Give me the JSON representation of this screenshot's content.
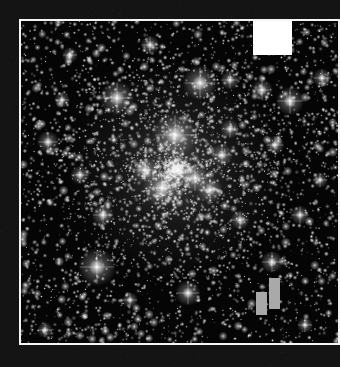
{
  "image": {
    "subject": "star cluster field (grayscale)",
    "width": 340,
    "height": 367,
    "colors": {
      "outer_background": "#141414",
      "frame": "#f4f4f4",
      "field_background": "#050505",
      "marker_square": "#ffffff",
      "bars": "#a9a9a9"
    }
  },
  "frame": {
    "x": 19,
    "y": 19,
    "width": 321,
    "height": 326
  },
  "overlay": {
    "marker_square": {
      "x": 253,
      "y": 21,
      "width": 39,
      "height": 34
    },
    "bars": [
      {
        "x": 256,
        "y": 292,
        "width": 11,
        "height": 23
      },
      {
        "x": 269,
        "y": 278,
        "width": 11,
        "height": 31
      }
    ]
  },
  "bright_stars": [
    {
      "x": 175,
      "y": 135,
      "r": 14
    },
    {
      "x": 117,
      "y": 98,
      "r": 11
    },
    {
      "x": 200,
      "y": 83,
      "r": 11
    },
    {
      "x": 290,
      "y": 101,
      "r": 9
    },
    {
      "x": 97,
      "y": 267,
      "r": 12
    },
    {
      "x": 162,
      "y": 188,
      "r": 12
    },
    {
      "x": 178,
      "y": 170,
      "r": 10
    },
    {
      "x": 195,
      "y": 178,
      "r": 9
    },
    {
      "x": 210,
      "y": 190,
      "r": 8
    },
    {
      "x": 145,
      "y": 170,
      "r": 8
    },
    {
      "x": 188,
      "y": 293,
      "r": 8
    },
    {
      "x": 103,
      "y": 215,
      "r": 7
    },
    {
      "x": 48,
      "y": 142,
      "r": 7
    },
    {
      "x": 262,
      "y": 90,
      "r": 7
    },
    {
      "x": 275,
      "y": 145,
      "r": 6
    },
    {
      "x": 272,
      "y": 262,
      "r": 7
    },
    {
      "x": 322,
      "y": 78,
      "r": 6
    },
    {
      "x": 230,
      "y": 80,
      "r": 6
    },
    {
      "x": 230,
      "y": 129,
      "r": 6
    },
    {
      "x": 240,
      "y": 220,
      "r": 6
    },
    {
      "x": 62,
      "y": 100,
      "r": 5
    },
    {
      "x": 80,
      "y": 175,
      "r": 6
    },
    {
      "x": 300,
      "y": 215,
      "r": 6
    },
    {
      "x": 130,
      "y": 300,
      "r": 5
    },
    {
      "x": 45,
      "y": 330,
      "r": 5
    },
    {
      "x": 305,
      "y": 325,
      "r": 5
    },
    {
      "x": 150,
      "y": 45,
      "r": 6
    },
    {
      "x": 70,
      "y": 55,
      "r": 5
    },
    {
      "x": 320,
      "y": 180,
      "r": 5
    },
    {
      "x": 222,
      "y": 155,
      "r": 7
    }
  ]
}
